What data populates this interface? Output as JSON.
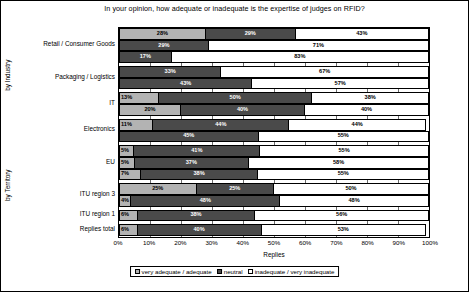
{
  "chart_data": {
    "type": "bar",
    "orientation": "horizontal",
    "stacked": true,
    "stacked_percent": true,
    "title": "In your opinion, how adequate or inadequate is the expertise of judges on RFID?",
    "xlabel": "Replies",
    "ylabel": "",
    "xlim": [
      0,
      100
    ],
    "xticks": [
      "0%",
      "10%",
      "20%",
      "30%",
      "40%",
      "50%",
      "60%",
      "70%",
      "80%",
      "90%",
      "100%"
    ],
    "grid": true,
    "legend_position": "bottom",
    "legend": [
      "very adequate / adequate",
      "neutral",
      "inadequate / very inadequate"
    ],
    "series": [
      {
        "name": "very adequate / adequate",
        "color": "#b3b3b3"
      },
      {
        "name": "neutral",
        "color": "#4a4a4a"
      },
      {
        "name": "inadequate / very inadequate",
        "color": "#ffffff"
      }
    ],
    "axis_groups": [
      {
        "label": "by Industry"
      },
      {
        "label": "by Territory"
      }
    ],
    "categories": [
      {
        "label": "Retail / Consumer Goods",
        "group": "by Industry",
        "bars": [
          {
            "values": [
              28,
              29,
              43
            ],
            "labels": [
              "28%",
              "29%",
              "43%"
            ]
          },
          {
            "values": [
              29,
              71
            ],
            "labels": [
              "29%",
              "71%"
            ]
          },
          {
            "values": [
              17,
              83
            ],
            "labels": [
              "17%",
              "83%"
            ]
          }
        ]
      },
      {
        "label": "Packaging / Logistics",
        "group": "by Industry",
        "bars": [
          {
            "values": [
              33,
              67
            ],
            "labels": [
              "33%",
              "67%"
            ]
          },
          {
            "values": [
              43,
              57
            ],
            "labels": [
              "43%",
              "57%"
            ]
          }
        ]
      },
      {
        "label": "IT",
        "group": "by Industry",
        "bars": [
          {
            "values": [
              13,
              50,
              38
            ],
            "labels": [
              "13%",
              "50%",
              "38%"
            ]
          },
          {
            "values": [
              20,
              40,
              40
            ],
            "labels": [
              "20%",
              "40%",
              "40%"
            ]
          }
        ]
      },
      {
        "label": "Electronics",
        "group": "by Industry",
        "bars": [
          {
            "values": [
              11,
              44,
              44
            ],
            "labels": [
              "11%",
              "44%",
              "44%"
            ]
          },
          {
            "values": [
              45,
              55
            ],
            "labels": [
              "45%",
              "55%"
            ]
          }
        ]
      },
      {
        "label": "EU",
        "group": "by Territory",
        "bars": [
          {
            "values": [
              5,
              41,
              55
            ],
            "labels": [
              "5%",
              "41%",
              "55%"
            ]
          },
          {
            "values": [
              5,
              37,
              58
            ],
            "labels": [
              "5%",
              "37%",
              "58%"
            ]
          },
          {
            "values": [
              7,
              38,
              55
            ],
            "labels": [
              "7%",
              "38%",
              "55%"
            ]
          }
        ]
      },
      {
        "label": "ITU region 3",
        "group": "by Territory",
        "bars": [
          {
            "values": [
              25,
              25,
              50
            ],
            "labels": [
              "25%",
              "25%",
              "50%"
            ]
          },
          {
            "values": [
              4,
              48,
              48
            ],
            "labels": [
              "4%",
              "48%",
              "48%"
            ]
          }
        ]
      },
      {
        "label": "ITU region 1",
        "group": "by Territory",
        "bars": [
          {
            "values": [
              6,
              38,
              56
            ],
            "labels": [
              "6%",
              "38%",
              "56%"
            ]
          }
        ]
      },
      {
        "label": "Replies total",
        "group": "by Territory",
        "bars": [
          {
            "values": [
              6,
              40,
              53
            ],
            "labels": [
              "6%",
              "40%",
              "53%"
            ]
          }
        ]
      }
    ]
  }
}
